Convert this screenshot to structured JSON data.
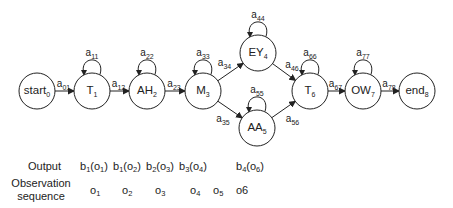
{
  "diagram": {
    "type": "hmm-state-chain",
    "nodes": [
      {
        "id": "start",
        "label": "start",
        "sub": "0",
        "cx": 37,
        "cy": 91,
        "self_loop": null
      },
      {
        "id": "T1",
        "label": "T",
        "sub": "1",
        "cx": 92,
        "cy": 91,
        "self_loop": {
          "label": "a",
          "sub": "11"
        }
      },
      {
        "id": "AH2",
        "label": "AH",
        "sub": "2",
        "cx": 147,
        "cy": 91,
        "self_loop": {
          "label": "a",
          "sub": "22"
        }
      },
      {
        "id": "M3",
        "label": "M",
        "sub": "3",
        "cx": 203,
        "cy": 91,
        "self_loop": {
          "label": "a",
          "sub": "33"
        }
      },
      {
        "id": "EY4",
        "label": "EY",
        "sub": "4",
        "cx": 258,
        "cy": 53,
        "self_loop": {
          "label": "a",
          "sub": "44"
        }
      },
      {
        "id": "AA5",
        "label": "AA",
        "sub": "5",
        "cx": 257,
        "cy": 128,
        "self_loop": {
          "label": "a",
          "sub": "55"
        }
      },
      {
        "id": "T6",
        "label": "T",
        "sub": "6",
        "cx": 310,
        "cy": 91,
        "self_loop": {
          "label": "a",
          "sub": "66"
        }
      },
      {
        "id": "OW7",
        "label": "OW",
        "sub": "7",
        "cx": 363,
        "cy": 91,
        "self_loop": {
          "label": "a",
          "sub": "77"
        }
      },
      {
        "id": "end",
        "label": "end",
        "sub": "8",
        "cx": 417,
        "cy": 91,
        "self_loop": null
      }
    ],
    "edges": [
      {
        "from": "start",
        "to": "T1",
        "label": "a",
        "sub": "01"
      },
      {
        "from": "T1",
        "to": "AH2",
        "label": "a",
        "sub": "12"
      },
      {
        "from": "AH2",
        "to": "M3",
        "label": "a",
        "sub": "23"
      },
      {
        "from": "M3",
        "to": "EY4",
        "label": "a",
        "sub": "34"
      },
      {
        "from": "M3",
        "to": "AA5",
        "label": "a",
        "sub": "35"
      },
      {
        "from": "EY4",
        "to": "T6",
        "label": "a",
        "sub": "46"
      },
      {
        "from": "AA5",
        "to": "T6",
        "label": "a",
        "sub": "56"
      },
      {
        "from": "T6",
        "to": "OW7",
        "label": "a",
        "sub": "67"
      },
      {
        "from": "OW7",
        "to": "end",
        "label": "a",
        "sub": "78"
      }
    ]
  },
  "table": {
    "output_label": "Output",
    "observation_label_line1": "Observation",
    "observation_label_line2": "sequence",
    "outputs": [
      {
        "b": "b",
        "bsub": "1",
        "o": "o",
        "osub": "1",
        "x": 80
      },
      {
        "b": "b",
        "bsub": "1",
        "o": "o",
        "osub": "2",
        "x": 113
      },
      {
        "b": "b",
        "bsub": "2",
        "o": "o",
        "osub": "3",
        "x": 146
      },
      {
        "b": "b",
        "bsub": "3",
        "o": "o",
        "osub": "4",
        "x": 179
      },
      {
        "b": "b",
        "bsub": "4",
        "o": "o",
        "osub": "6",
        "x": 236
      }
    ],
    "observations": [
      {
        "o": "o",
        "sub": "1",
        "x": 90
      },
      {
        "o": "o",
        "sub": "2",
        "x": 122
      },
      {
        "o": "o",
        "sub": "3",
        "x": 155
      },
      {
        "o": "o",
        "sub": "4",
        "x": 190
      },
      {
        "o": "o",
        "sub": "5",
        "x": 213
      },
      {
        "o": "o6",
        "sub": "",
        "x": 236
      }
    ]
  }
}
